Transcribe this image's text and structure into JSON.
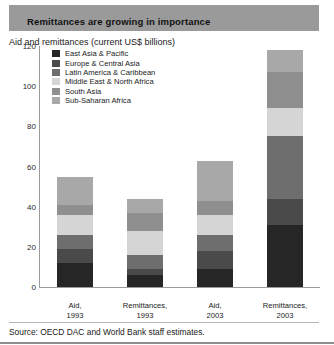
{
  "banner": {
    "title": "Remittances are growing in importance"
  },
  "subtitle": "Aid and remittances (current US$ billions)",
  "source": "Source: OECD DAC and World Bank staff estimates.",
  "colors": {
    "banner_bg": "#9a9a9a",
    "axis": "#9b9b9b",
    "series": {
      "east_asia_pacific": "#262626",
      "europe_central_asia": "#4a4a4a",
      "latin_america_caribbean": "#6e6e6e",
      "middle_east_north_africa": "#d5d5d5",
      "south_asia": "#8f8f8f",
      "sub_saharan_africa": "#a8a8a8"
    }
  },
  "chart_data": {
    "type": "bar",
    "stacked": true,
    "title": "Remittances are growing in importance",
    "subtitle": "Aid and remittances (current US$ billions)",
    "xlabel": "",
    "ylabel": "current US$ billions",
    "ylim": [
      0,
      120
    ],
    "yticks": [
      0,
      20,
      40,
      60,
      80,
      100,
      120
    ],
    "grid": false,
    "legend_position": "inside-top-left",
    "categories": [
      "Aid,\n1993",
      "Remittances,\n1993",
      "Aid,\n2003",
      "Remittances,\n2003"
    ],
    "category_labels": [
      {
        "line1": "Aid,",
        "line2": "1993"
      },
      {
        "line1": "Remittances,",
        "line2": "1993"
      },
      {
        "line1": "Aid,",
        "line2": "2003"
      },
      {
        "line1": "Remittances,",
        "line2": "2003"
      }
    ],
    "series": [
      {
        "name": "East Asia & Pacific",
        "color": "#262626",
        "values": [
          12,
          6,
          9,
          31
        ]
      },
      {
        "name": "Europe & Central Asia",
        "color": "#4a4a4a",
        "values": [
          7,
          3,
          9,
          13
        ]
      },
      {
        "name": "Latin America & Caribbean",
        "color": "#6e6e6e",
        "values": [
          7,
          7,
          8,
          31
        ]
      },
      {
        "name": "Middle East & North Africa",
        "color": "#d5d5d5",
        "values": [
          10,
          12,
          10,
          14
        ]
      },
      {
        "name": "South Asia",
        "color": "#8f8f8f",
        "values": [
          5,
          9,
          7,
          18
        ]
      },
      {
        "name": "Sub-Saharan Africa",
        "color": "#a8a8a8",
        "values": [
          14,
          7,
          20,
          11
        ]
      }
    ],
    "totals": [
      55,
      44,
      63,
      118
    ]
  },
  "legend": {
    "items": [
      {
        "label": "East Asia & Pacific",
        "color": "#262626"
      },
      {
        "label": "Europe & Central Asia",
        "color": "#4a4a4a"
      },
      {
        "label": "Latin America & Caribbean",
        "color": "#6e6e6e"
      },
      {
        "label": "Middle East & North Africa",
        "color": "#d5d5d5"
      },
      {
        "label": "South Asia",
        "color": "#8f8f8f"
      },
      {
        "label": "Sub-Saharan Africa",
        "color": "#a8a8a8"
      }
    ]
  }
}
